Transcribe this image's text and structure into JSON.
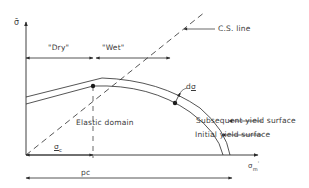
{
  "diagram": {
    "title": "",
    "axes": {
      "y_label": "σ̄",
      "x_label": "σm'",
      "x_label_main": "σ",
      "x_label_sub": "m",
      "x_label_prime": "'"
    },
    "regions": {
      "dry_label": "\"Dry\"",
      "wet_label": "\"Wet\""
    },
    "lines": {
      "cs_line_label": "C.S. line"
    },
    "annotations": {
      "elastic_domain": "Elastic domain",
      "stress_increment": "dσ",
      "stress_increment_main": "d",
      "stress_increment_sym": "σ",
      "subsequent_yield_surface": "Subsequent yield surface",
      "initial_yield_surface": "Initial yield surface"
    },
    "dimensions": {
      "sigma_c_label": "σ",
      "sigma_c_sub": "c",
      "pc_label": "pc"
    },
    "colors": {
      "line": "#2a2a2a",
      "text": "#3a3a3a",
      "background": "#ffffff"
    }
  }
}
